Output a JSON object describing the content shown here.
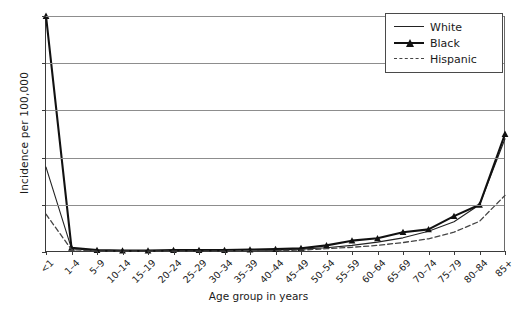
{
  "chart_data": {
    "type": "line",
    "title": "",
    "xlabel": "Age group in years",
    "ylabel": "Incidence per 100,000",
    "xlim_categories": 19,
    "ylim": [
      0,
      50
    ],
    "yticks": [
      0,
      10,
      20,
      30,
      40,
      50
    ],
    "grid": "horizontal",
    "legend_position": "top-right",
    "categories": [
      "<1",
      "1–4",
      "5–9",
      "10–14",
      "15–19",
      "20–24",
      "25–29",
      "30–34",
      "35–39",
      "40–44",
      "45–49",
      "50–54",
      "55–59",
      "60–64",
      "65–69",
      "70–74",
      "75–79",
      "80–84",
      "85+"
    ],
    "series": [
      {
        "name": "White",
        "style": "solid-thin",
        "color": "#222222",
        "marker": "none",
        "values": [
          18.0,
          0.7,
          0.3,
          0.2,
          0.2,
          0.3,
          0.3,
          0.3,
          0.4,
          0.4,
          0.6,
          0.9,
          1.4,
          2.1,
          3.0,
          4.4,
          6.4,
          10.0,
          24.0
        ]
      },
      {
        "name": "Black",
        "style": "solid-thick",
        "color": "#111111",
        "marker": "triangle",
        "values": [
          50.0,
          0.9,
          0.4,
          0.3,
          0.3,
          0.4,
          0.4,
          0.4,
          0.5,
          0.6,
          0.8,
          1.4,
          2.4,
          2.9,
          4.2,
          4.8,
          7.6,
          10.0,
          25.0
        ]
      },
      {
        "name": "Hispanic",
        "style": "dashed",
        "color": "#444444",
        "marker": "none",
        "values": [
          8.0,
          0.5,
          0.2,
          0.2,
          0.2,
          0.2,
          0.2,
          0.2,
          0.3,
          0.3,
          0.4,
          0.7,
          1.0,
          1.4,
          2.0,
          2.8,
          4.2,
          6.5,
          12.0
        ]
      }
    ]
  },
  "legend": {
    "items": [
      {
        "label": "White"
      },
      {
        "label": "Black"
      },
      {
        "label": "Hispanic"
      }
    ]
  }
}
